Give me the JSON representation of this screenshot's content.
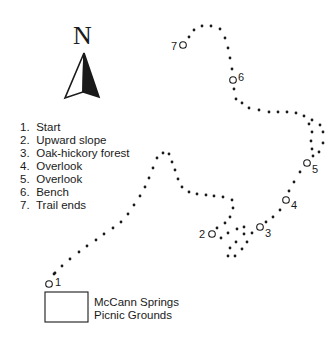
{
  "compass": {
    "label": "N",
    "icon": "north-arrow-icon"
  },
  "legend": {
    "items": [
      {
        "number": "1.",
        "label": "Start"
      },
      {
        "number": "2.",
        "label": "Upward slope"
      },
      {
        "number": "3.",
        "label": "Oak-hickory forest"
      },
      {
        "number": "4.",
        "label": "Overlook"
      },
      {
        "number": "5.",
        "label": "Overlook"
      },
      {
        "number": "6.",
        "label": "Bench"
      },
      {
        "number": "7.",
        "label": "Trail ends"
      }
    ]
  },
  "picnic_area": {
    "line1": "McCann Springs",
    "line2": "Picnic Grounds"
  },
  "stops": [
    {
      "label": "1",
      "cx": 49,
      "cy": 284,
      "lx": 55,
      "ly": 277
    },
    {
      "label": "2",
      "cx": 212,
      "cy": 234,
      "lx": 199,
      "ly": 229
    },
    {
      "label": "3",
      "cx": 260,
      "cy": 227,
      "lx": 265,
      "ly": 228
    },
    {
      "label": "4",
      "cx": 286,
      "cy": 200,
      "lx": 291,
      "ly": 200
    },
    {
      "label": "5",
      "cx": 307,
      "cy": 163,
      "lx": 312,
      "ly": 164
    },
    {
      "label": "6",
      "cx": 233,
      "cy": 80,
      "lx": 238,
      "ly": 72
    },
    {
      "label": "7",
      "cx": 183,
      "cy": 45,
      "lx": 171,
      "ly": 41
    }
  ],
  "trail_dots": [
    [
      54,
      274
    ],
    [
      55,
      273
    ],
    [
      62,
      266
    ],
    [
      70,
      259
    ],
    [
      79,
      252
    ],
    [
      87,
      246
    ],
    [
      96,
      240
    ],
    [
      104,
      234
    ],
    [
      113,
      228
    ],
    [
      121,
      222
    ],
    [
      128,
      214
    ],
    [
      134,
      205
    ],
    [
      140,
      196
    ],
    [
      145,
      187
    ],
    [
      149,
      178
    ],
    [
      153,
      168
    ],
    [
      157,
      158
    ],
    [
      163,
      153
    ],
    [
      169,
      154
    ],
    [
      172,
      162
    ],
    [
      175,
      170
    ],
    [
      178,
      179
    ],
    [
      182,
      187
    ],
    [
      189,
      192
    ],
    [
      197,
      194
    ],
    [
      206,
      195
    ],
    [
      214,
      196
    ],
    [
      223,
      197
    ],
    [
      232,
      200
    ],
    [
      233,
      208
    ],
    [
      230,
      217
    ],
    [
      225,
      223
    ],
    [
      217,
      228
    ],
    [
      221,
      238
    ],
    [
      228,
      233
    ],
    [
      237,
      229
    ],
    [
      244,
      227
    ],
    [
      244,
      234
    ],
    [
      236,
      242
    ],
    [
      247,
      242
    ],
    [
      230,
      248
    ],
    [
      242,
      249
    ],
    [
      228,
      256
    ],
    [
      235,
      256
    ],
    [
      252,
      233
    ],
    [
      266,
      222
    ],
    [
      273,
      217
    ],
    [
      280,
      210
    ],
    [
      289,
      191
    ],
    [
      294,
      182
    ],
    [
      300,
      172
    ],
    [
      313,
      156
    ],
    [
      319,
      152
    ],
    [
      312,
      149
    ],
    [
      323,
      143
    ],
    [
      311,
      141
    ],
    [
      323,
      132
    ],
    [
      312,
      132
    ],
    [
      320,
      125
    ],
    [
      309,
      124
    ],
    [
      312,
      120
    ],
    [
      304,
      116
    ],
    [
      296,
      113
    ],
    [
      287,
      112
    ],
    [
      278,
      112
    ],
    [
      269,
      112
    ],
    [
      259,
      110
    ],
    [
      249,
      108
    ],
    [
      242,
      103
    ],
    [
      236,
      99
    ],
    [
      234,
      89
    ],
    [
      233,
      79
    ],
    [
      232,
      69
    ],
    [
      230,
      58
    ],
    [
      228,
      48
    ],
    [
      225,
      38
    ],
    [
      220,
      29
    ],
    [
      211,
      26
    ],
    [
      202,
      26
    ],
    [
      194,
      30
    ],
    [
      189,
      37
    ]
  ],
  "colors": {
    "ink": "#1a1a1a",
    "background": "#ffffff"
  }
}
